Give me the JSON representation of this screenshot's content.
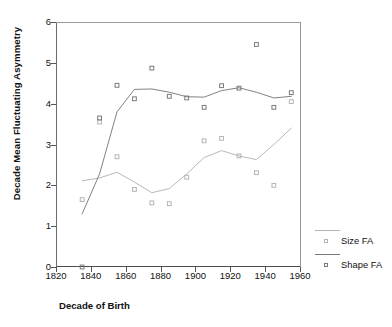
{
  "chart_data": {
    "type": "line",
    "title": "",
    "xlabel": "Decade of Birth",
    "ylabel": "Decade Mean Fluctuating Asymmetry",
    "xlim": [
      1820,
      1960
    ],
    "ylim": [
      0,
      6
    ],
    "xticks": [
      1820,
      1840,
      1860,
      1880,
      1900,
      1920,
      1940,
      1960
    ],
    "xtick_labels": [
      "1820",
      "1840",
      "1860",
      "1880",
      "1900",
      "1920",
      "1940",
      "1960"
    ],
    "yticks": [
      0,
      1,
      2,
      3,
      4,
      5,
      6
    ],
    "ytick_labels": [
      "0",
      "1",
      "2",
      "3",
      "4",
      "5",
      "6"
    ],
    "grid": false,
    "legend_position": "right",
    "colors": {
      "size_fa": "#b4b4b4",
      "shape_fa": "#7a7a7a",
      "axis": "#555555",
      "text": "#111111"
    },
    "series": [
      {
        "name": "Size FA",
        "color": "#b4b4b4",
        "marker": "open-square",
        "x": [
          1835,
          1845,
          1855,
          1865,
          1875,
          1885,
          1895,
          1905,
          1915,
          1925,
          1935,
          1945,
          1955
        ],
        "line_y": [
          2.11,
          2.18,
          2.32,
          2.08,
          1.82,
          1.92,
          2.28,
          2.68,
          2.85,
          2.72,
          2.63,
          3.0,
          3.4
        ],
        "points_x": [
          1835,
          1845,
          1855,
          1865,
          1875,
          1885,
          1895,
          1905,
          1915,
          1925,
          1935,
          1945,
          1955
        ],
        "points_y": [
          1.65,
          3.55,
          2.7,
          1.9,
          1.57,
          1.55,
          2.2,
          3.09,
          3.15,
          2.72,
          2.31,
          2.0,
          4.05
        ]
      },
      {
        "name": "Shape FA",
        "color": "#7a7a7a",
        "marker": "open-square",
        "x": [
          1835,
          1845,
          1855,
          1865,
          1875,
          1885,
          1895,
          1905,
          1915,
          1925,
          1935,
          1945,
          1955
        ],
        "line_y": [
          1.3,
          2.28,
          3.8,
          4.35,
          4.36,
          4.28,
          4.17,
          4.16,
          4.32,
          4.39,
          4.28,
          4.14,
          4.18
        ],
        "points_x": [
          1835,
          1845,
          1855,
          1865,
          1875,
          1885,
          1895,
          1905,
          1915,
          1925,
          1935,
          1945,
          1955
        ],
        "points_y": [
          0.0,
          3.65,
          4.45,
          4.12,
          4.87,
          4.18,
          4.14,
          3.91,
          4.44,
          4.38,
          5.45,
          3.91,
          4.27
        ]
      }
    ],
    "legend_entries": [
      {
        "label": "Size FA",
        "color": "#b4b4b4"
      },
      {
        "label": "Shape FA",
        "color": "#7a7a7a"
      }
    ]
  }
}
